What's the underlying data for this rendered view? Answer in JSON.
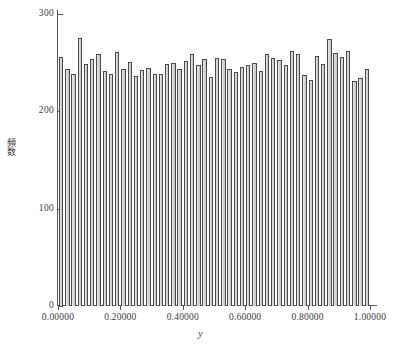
{
  "chart_data": {
    "type": "bar",
    "title": "",
    "subtitle": "",
    "xlabel": "y",
    "ylabel": "頻数",
    "xlim": [
      0.0,
      1.0
    ],
    "ylim": [
      0,
      300
    ],
    "grid": false,
    "legend": null,
    "y_ticks": [
      0,
      100,
      200,
      300
    ],
    "y_tick_labels": [
      "0",
      "100",
      "200",
      "300"
    ],
    "x_ticks": [
      0.0,
      0.2,
      0.4,
      0.6,
      0.8,
      1.0
    ],
    "x_tick_labels": [
      "0.00000",
      "0.20000",
      "0.40000",
      "0.60000",
      "0.80000",
      "1.00000"
    ],
    "bin_count": 50,
    "bin_width": 0.02,
    "categories": [
      "0.00",
      "0.02",
      "0.04",
      "0.06",
      "0.08",
      "0.10",
      "0.12",
      "0.14",
      "0.16",
      "0.18",
      "0.20",
      "0.22",
      "0.24",
      "0.26",
      "0.28",
      "0.30",
      "0.32",
      "0.34",
      "0.36",
      "0.38",
      "0.40",
      "0.42",
      "0.44",
      "0.46",
      "0.48",
      "0.50",
      "0.52",
      "0.54",
      "0.56",
      "0.58",
      "0.60",
      "0.62",
      "0.64",
      "0.66",
      "0.68",
      "0.70",
      "0.72",
      "0.74",
      "0.76",
      "0.78",
      "0.80",
      "0.82",
      "0.84",
      "0.86",
      "0.88",
      "0.90",
      "0.92",
      "0.94",
      "0.96",
      "0.98"
    ],
    "values": [
      256,
      243,
      238,
      275,
      249,
      254,
      259,
      241,
      238,
      261,
      243,
      251,
      236,
      242,
      245,
      238,
      238,
      249,
      250,
      243,
      252,
      259,
      248,
      254,
      235,
      255,
      254,
      244,
      240,
      246,
      248,
      250,
      241,
      259,
      255,
      253,
      248,
      262,
      259,
      237,
      232,
      257,
      249,
      274,
      260,
      256,
      262,
      231,
      234,
      244
    ],
    "bar_face_color": "#d4d4d4",
    "bar_edge_color": "#4a4a4a",
    "axis_color": "#555555",
    "background_color": "#ffffff"
  },
  "axes": {
    "y_title": "頻数",
    "x_title": "y"
  }
}
